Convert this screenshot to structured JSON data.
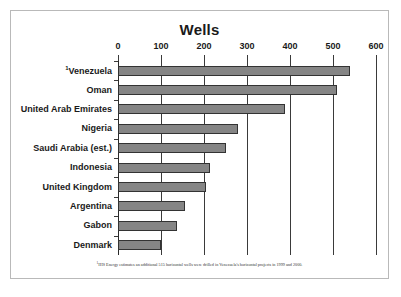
{
  "chart_data": {
    "type": "bar",
    "orientation": "horizontal",
    "title": "Wells",
    "xlabel": "",
    "ylabel": "",
    "xlim": [
      0,
      600
    ],
    "xticks": [
      0,
      100,
      200,
      300,
      400,
      500,
      600
    ],
    "grid": true,
    "legend": null,
    "categories": [
      "Venezuela",
      "Oman",
      "United Arab Emirates",
      "Nigeria",
      "Saudi Arabia (est.)",
      "Indonesia",
      "United Kingdom",
      "Argentina",
      "Gabon",
      "Denmark"
    ],
    "values": [
      540,
      510,
      388,
      278,
      250,
      213,
      205,
      155,
      138,
      100
    ],
    "category_footnote_markers": [
      "1",
      "",
      "",
      "",
      "",
      "",
      "",
      "",
      "",
      ""
    ],
    "annotations": [
      "IHS Energy estimates an additional 515 horizontal wells were drilled in Venezuela's horizontal projects in 1999 and 2000."
    ],
    "colors": {
      "bar_fill": "#858585",
      "bar_border": "#333333",
      "gridline": "#3a3a3a",
      "text": "#1a1a1a",
      "frame": "#b9b9b9",
      "background": "#ffffff"
    }
  },
  "footnote": {
    "marker": "1",
    "text": "IHS Energy estimates an additional 515 horizontal wells were drilled in Venezuela's horizontal projects in 1999 and 2000."
  }
}
